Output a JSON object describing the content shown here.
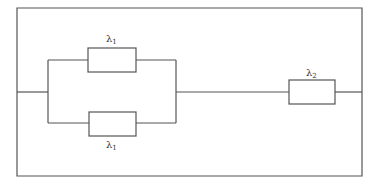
{
  "diagram": {
    "type": "reliability block diagram",
    "colors": {
      "line": "#555555",
      "background": "#ffffff",
      "text": "#333333"
    },
    "components": [
      {
        "id": "top-parallel",
        "symbol": "λ",
        "subscript": "1",
        "position": "upper branch"
      },
      {
        "id": "bottom-parallel",
        "symbol": "λ",
        "subscript": "1",
        "position": "lower branch"
      },
      {
        "id": "series",
        "symbol": "λ",
        "subscript": "2",
        "position": "series element"
      }
    ]
  }
}
